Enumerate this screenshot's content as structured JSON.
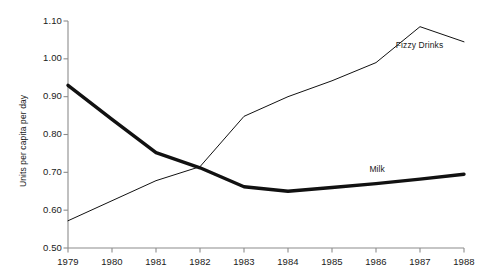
{
  "chart_data": {
    "type": "line",
    "title": "",
    "xlabel": "",
    "ylabel": "Units per capita per day",
    "x": [
      1979,
      1980,
      1981,
      1982,
      1983,
      1984,
      1985,
      1986,
      1987,
      1988
    ],
    "categories": [
      "1979",
      "1980",
      "1981",
      "1982",
      "1983",
      "1984",
      "1985",
      "1986",
      "1987",
      "1988"
    ],
    "xlim": [
      1979,
      1988
    ],
    "ylim": [
      0.5,
      1.1
    ],
    "ytick_values": [
      0.5,
      0.6,
      0.7,
      0.8,
      0.9,
      1.0,
      1.1
    ],
    "ytick_labels": [
      "0.50",
      "0.60",
      "0.70",
      "0.80",
      "0.90",
      "1.00",
      "1.10"
    ],
    "grid": false,
    "legend": "inline-annotation",
    "series": [
      {
        "name": "Milk",
        "values": [
          0.93,
          0.84,
          0.752,
          0.712,
          0.662,
          0.65,
          0.66,
          0.67,
          0.682,
          0.695
        ],
        "color": "#111111",
        "line_width": 3.4,
        "label_x": 1985.85,
        "label_y": 0.706
      },
      {
        "name": "Fizzy Drinks",
        "values": [
          0.572,
          0.625,
          0.678,
          0.715,
          0.848,
          0.9,
          0.942,
          0.99,
          1.085,
          1.045
        ],
        "color": "#111111",
        "line_width": 1.0,
        "label_x": 1986.45,
        "label_y": 1.035
      }
    ]
  },
  "axis": {
    "y_axis_color": "#8c8c8c",
    "x_axis_color": "#8c8c8c",
    "tick_color": "#8c8c8c"
  }
}
